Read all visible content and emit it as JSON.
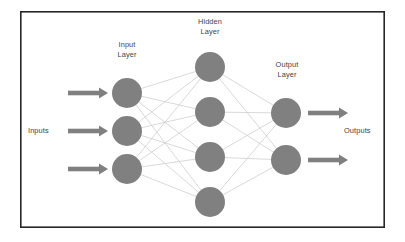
{
  "diagram": {
    "title_labels": {
      "input_layer": "Input\nLayer",
      "input_layer_line1": "Input",
      "input_layer_line2": "Layer",
      "hidden_layer_line1": "Hidden",
      "hidden_layer_line2": "Layer",
      "output_layer_line1": "Output",
      "output_layer_line2": "Layer",
      "inputs": "Inputs",
      "outputs": "Outputs"
    },
    "colors": {
      "node_fill": "#808080",
      "edge_stroke": "#c9c9c9",
      "arrow_fill": "#808080",
      "frame_stroke": "#262626",
      "background": "#ffffff",
      "text": "#3f3f3f"
    },
    "frame": {
      "x": 20,
      "y": 11,
      "width": 365,
      "height": 217,
      "stroke_width": 1.6
    },
    "geometry": {
      "node_radius": 15,
      "edge_width": 0.7
    },
    "layers": [
      {
        "name": "input-layer",
        "label": "Input Layer",
        "node_count": 3,
        "cx": 127,
        "nodes": [
          {
            "id": "input-node-1",
            "cx": 127,
            "cy": 93
          },
          {
            "id": "input-node-2",
            "cx": 127,
            "cy": 131
          },
          {
            "id": "input-node-3",
            "cx": 127,
            "cy": 169
          }
        ]
      },
      {
        "name": "hidden-layer",
        "label": "Hidden Layer",
        "node_count": 4,
        "cx": 210,
        "nodes": [
          {
            "id": "hidden-node-1",
            "cx": 210,
            "cy": 67
          },
          {
            "id": "hidden-node-2",
            "cx": 210,
            "cy": 112
          },
          {
            "id": "hidden-node-3",
            "cx": 210,
            "cy": 157
          },
          {
            "id": "hidden-node-4",
            "cx": 210,
            "cy": 202
          }
        ]
      },
      {
        "name": "output-layer",
        "label": "Output Layer",
        "node_count": 2,
        "cx": 286,
        "nodes": [
          {
            "id": "output-node-1",
            "cx": 286,
            "cy": 113
          },
          {
            "id": "output-node-2",
            "cx": 286,
            "cy": 160
          }
        ]
      }
    ],
    "connections": {
      "input_to_hidden": "fully-connected",
      "hidden_to_output": "fully-connected"
    },
    "input_arrows": [
      {
        "id": "input-arrow-1",
        "x1": 68,
        "x2": 108,
        "y": 93
      },
      {
        "id": "input-arrow-2",
        "x1": 68,
        "x2": 108,
        "y": 131
      },
      {
        "id": "input-arrow-3",
        "x1": 68,
        "x2": 108,
        "y": 169
      }
    ],
    "output_arrows": [
      {
        "id": "output-arrow-1",
        "x1": 308,
        "x2": 348,
        "y": 113
      },
      {
        "id": "output-arrow-2",
        "x1": 308,
        "x2": 348,
        "y": 160
      }
    ]
  }
}
